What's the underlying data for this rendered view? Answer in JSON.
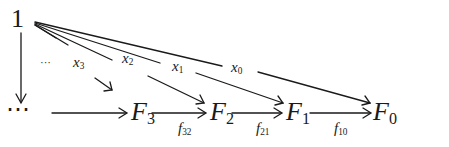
{
  "diagram": {
    "type": "commutative-diagram",
    "nodes": [
      {
        "id": "one",
        "label": "1",
        "sub": ""
      },
      {
        "id": "dots",
        "label": "⋯",
        "sub": ""
      },
      {
        "id": "F3",
        "label": "F",
        "sub": "3"
      },
      {
        "id": "F2",
        "label": "F",
        "sub": "2"
      },
      {
        "id": "F1",
        "label": "F",
        "sub": "1"
      },
      {
        "id": "F0",
        "label": "F",
        "sub": "0"
      }
    ],
    "edges": [
      {
        "from": "one",
        "to": "dots",
        "label": "",
        "sub": ""
      },
      {
        "from": "one",
        "to": "dots",
        "label": "···",
        "sub": ""
      },
      {
        "from": "one",
        "to": "F3",
        "label": "x",
        "sub": "3"
      },
      {
        "from": "one",
        "to": "F2",
        "label": "x",
        "sub": "2"
      },
      {
        "from": "one",
        "to": "F1",
        "label": "x",
        "sub": "1"
      },
      {
        "from": "one",
        "to": "F0",
        "label": "x",
        "sub": "0"
      },
      {
        "from": "dots",
        "to": "F3",
        "label": "",
        "sub": ""
      },
      {
        "from": "F3",
        "to": "F2",
        "label": "f",
        "sub": "32"
      },
      {
        "from": "F2",
        "to": "F1",
        "label": "f",
        "sub": "21"
      },
      {
        "from": "F1",
        "to": "F0",
        "label": "f",
        "sub": "10"
      }
    ]
  }
}
